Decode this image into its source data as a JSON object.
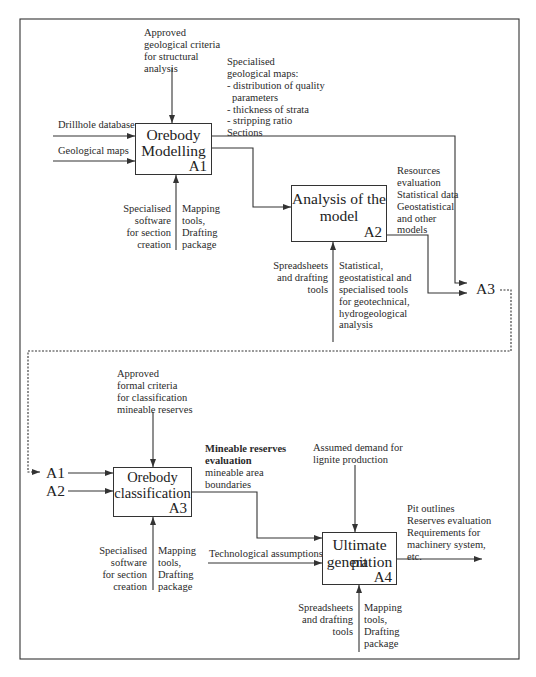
{
  "a1": {
    "title_lines": [
      "Orebody",
      "Modelling"
    ],
    "id": "A1",
    "inputs": [
      "Drillhole database",
      "Geological maps"
    ],
    "control_lines": [
      "Approved",
      "geological criteria",
      "for structural",
      "analysis"
    ],
    "output_lines": [
      "Specialised",
      "geological maps:",
      "- distribution of quality",
      "parameters",
      "- thickness of strata",
      "- stripping ratio",
      "Sections"
    ],
    "mechanism_left": [
      "Specialised",
      "software",
      "for section",
      "creation"
    ],
    "mechanism_right": [
      "Mapping",
      "tools,",
      "Drafting",
      "package"
    ]
  },
  "a2": {
    "title_lines": [
      "Analysis of the",
      "model"
    ],
    "id": "A2",
    "output_lines": [
      "Resources",
      "evaluation",
      "Statistical data",
      "Geostatistical",
      "and other",
      "models"
    ],
    "mechanism_left": [
      "Spreadsheets",
      "and drafting",
      "tools"
    ],
    "mechanism_right": [
      "Statistical,",
      "geostatistical and",
      "specialised tools",
      "for geotechnical,",
      "hydrogeological",
      "analysis"
    ]
  },
  "a3_ref": "A3",
  "a3": {
    "title_lines": [
      "Orebody",
      "classification"
    ],
    "id": "A3",
    "input_refs": [
      "A1",
      "A2"
    ],
    "control_lines": [
      "Approved",
      "formal criteria",
      "for classification",
      "mineable reserves"
    ],
    "output_bold_lines": [
      "Mineable reserves",
      "evaluation"
    ],
    "output_lines": [
      "mineable area",
      "boundaries"
    ],
    "mechanism_left": [
      "Specialised",
      "software",
      "for section",
      "creation"
    ],
    "mechanism_right": [
      "Mapping",
      "tools,",
      "Drafting",
      "package"
    ]
  },
  "a4": {
    "title_lines": [
      "Ultimate pit",
      "generation"
    ],
    "id": "A4",
    "input": "Technological assumptions",
    "control_lines": [
      "Assumed demand for",
      "lignite production"
    ],
    "output_lines": [
      "Pit outlines",
      "Reserves evaluation",
      "Requirements for",
      "machinery system,",
      "etc."
    ],
    "mechanism_left": [
      "Spreadsheets",
      "and drafting",
      "tools"
    ],
    "mechanism_right": [
      "Mapping",
      "tools,",
      "Drafting",
      "package"
    ]
  }
}
